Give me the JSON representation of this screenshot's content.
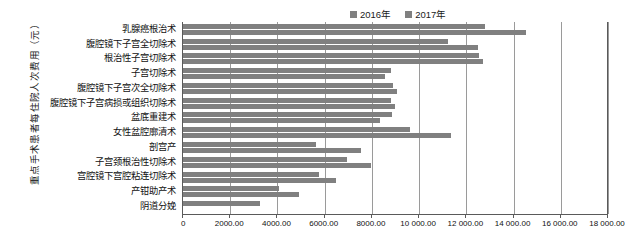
{
  "chart_data": {
    "type": "bar",
    "orientation": "horizontal",
    "title": "",
    "xlabel": "",
    "ylabel": "重点手术患者每住院人次费用（元）",
    "xlim": [
      0,
      18000
    ],
    "grid": true,
    "legend_position": "top-right",
    "xticks": [
      "0",
      "2000.00",
      "4000.00",
      "6000.00",
      "8000.00",
      "10 000.00",
      "12 000.00",
      "14 000.00",
      "16 000.00",
      "18 000.00"
    ],
    "xtick_values": [
      0,
      2000,
      4000,
      6000,
      8000,
      10000,
      12000,
      14000,
      16000,
      18000
    ],
    "categories": [
      "乳腺癌根治术",
      "腹腔镜下子宫全切除术",
      "根治性子宫切除术",
      "子宫切除术",
      "腹腔镜下子宫次全切除术",
      "腹腔镜下子宫病损或组织切除术",
      "盆底重建术",
      "女性盆腔廓清术",
      "剖宫产",
      "子宫颈根治性切除术",
      "宫腔镜下宫腔粘连切除术",
      "产钳助产术",
      "阴道分娩"
    ],
    "series": [
      {
        "name": "2016年",
        "color": "#808080",
        "values": [
          12770,
          11230,
          12540,
          8790,
          8880,
          8800,
          8840,
          9600,
          5630,
          6950,
          5750,
          4060,
          3280
        ]
      },
      {
        "name": "2017年",
        "color": "#808080",
        "values": [
          14520,
          12480,
          12700,
          8540,
          9060,
          8960,
          8350,
          11360,
          7520,
          7980,
          6460,
          4930,
          0
        ]
      }
    ]
  },
  "legend": {
    "items": [
      {
        "label": "2016年",
        "color": "#808080"
      },
      {
        "label": "2017年",
        "color": "#808080"
      }
    ]
  }
}
